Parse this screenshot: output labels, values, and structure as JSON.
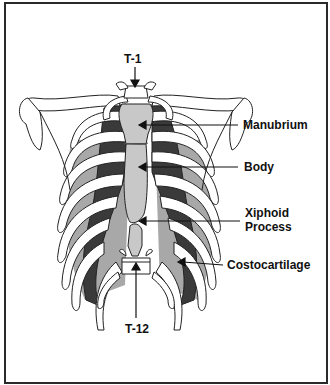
{
  "figure": {
    "labels": {
      "t1": "T-1",
      "manubrium": "Manubrium",
      "body": "Body",
      "xiphoid_line1": "Xiphoid",
      "xiphoid_line2": "Process",
      "costocartilage": "Costocartilage",
      "t12": "T-12"
    },
    "colors": {
      "frame": "#2a2a2a",
      "bone_fill": "#ffffff",
      "bone_stroke": "#222222",
      "sternum_fill": "#c8c8c8",
      "cartilage_dark": "#3a3a3a",
      "muscle_gray": "#9a9a9a",
      "background": "#ffffff"
    }
  }
}
